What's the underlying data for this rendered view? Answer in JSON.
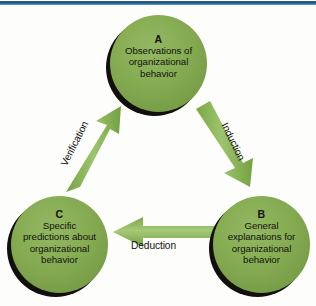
{
  "figure": {
    "top_rule_color": "#2f5f8f",
    "node_color": "#85ab52",
    "arrow_color": "#8fbc5f",
    "shadow_color": "#120f0c"
  },
  "nodes": [
    {
      "id": "A",
      "letter": "A",
      "lines": [
        "Observations of",
        "organizational",
        "behavior"
      ],
      "text": "Observations of organizational behavior"
    },
    {
      "id": "B",
      "letter": "B",
      "lines": [
        "General",
        "explanations for",
        "organizational",
        "behavior"
      ],
      "text": "General explanations for organizational behavior"
    },
    {
      "id": "C",
      "letter": "C",
      "lines": [
        "Specific",
        "predictions about",
        "organizational",
        "behavior"
      ],
      "text": "Specific predictions about organizational behavior"
    }
  ],
  "edges": [
    {
      "id": "induction",
      "label": "Induction",
      "from": "A",
      "to": "B"
    },
    {
      "id": "deduction",
      "label": "Deduction",
      "from": "B",
      "to": "C"
    },
    {
      "id": "verification",
      "label": "Verification",
      "from": "C",
      "to": "A"
    }
  ]
}
